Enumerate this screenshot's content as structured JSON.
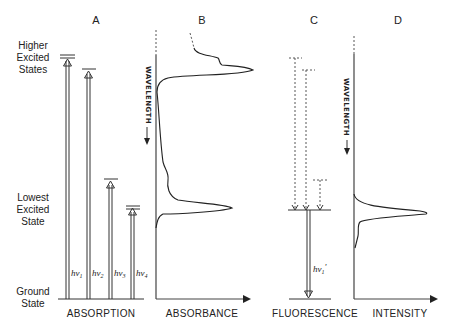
{
  "panels": {
    "A": {
      "letter": "A",
      "axis_label": "ABSORPTION"
    },
    "B": {
      "letter": "B",
      "axis_label": "ABSORBANCE",
      "vertical_label": "WAVELENGTH"
    },
    "C": {
      "letter": "C",
      "axis_label": "FLUORESCENCE"
    },
    "D": {
      "letter": "D",
      "axis_label": "INTENSITY",
      "vertical_label": "WAVELENGTH"
    }
  },
  "energy_levels": {
    "higher": [
      "Higher",
      "Excited",
      "States"
    ],
    "lowest": [
      "Lowest",
      "Excited",
      "State"
    ],
    "ground": [
      "Ground",
      "State"
    ]
  },
  "transitions": {
    "absorption": [
      {
        "label": "hν",
        "sub": "1"
      },
      {
        "label": "hν",
        "sub": "2"
      },
      {
        "label": "hν",
        "sub": "3"
      },
      {
        "label": "hν",
        "sub": "4"
      }
    ],
    "fluorescence": {
      "label": "hν",
      "sub": "1",
      "prime": "'"
    }
  },
  "colors": {
    "ink": "#222222",
    "background": "#ffffff"
  }
}
